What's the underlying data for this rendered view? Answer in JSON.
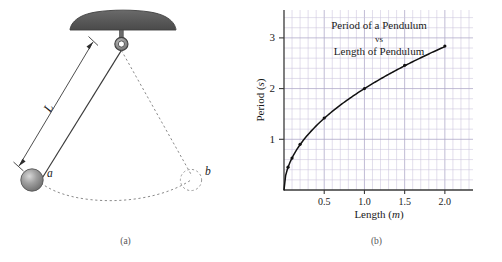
{
  "figure": {
    "panel_a": {
      "caption": "(a)",
      "labels": {
        "length": "L",
        "position_a": "a",
        "position_b": "b"
      },
      "parts": {
        "ceiling_mount": "ceiling-mount",
        "pivot_ring": "pivot-ring",
        "string": "pendulum-string",
        "bob": "pendulum-bob",
        "swing_arc": "swing-arc",
        "length_arrow": "length-dimension-arrow"
      },
      "colors": {
        "mount_fill": "#5c5c5c",
        "bob_fill": "#8f8f8f",
        "line": "#3a3a3a",
        "dash": "#7a7a7a"
      }
    },
    "panel_b": {
      "caption": "(b)",
      "colors": {
        "grid_minor": "#c9c3dd",
        "grid_major": "#b0a9c9",
        "axis": "#3a3a3a",
        "curve": "#111111"
      }
    }
  },
  "chart_data": {
    "type": "line",
    "title": "Period of a Pendulum\nvs\nLength of Pendulum",
    "title_lines": [
      "Period of a Pendulum",
      "vs",
      "Length of Pendulum"
    ],
    "xlabel": "Length (m)",
    "xlabel_main": "Length (",
    "xlabel_unit": "m",
    "xlabel_close": ")",
    "ylabel": "Period (s)",
    "ylabel_main": "Period (",
    "ylabel_unit": "s",
    "ylabel_close": ")",
    "xlim": [
      0,
      2.3
    ],
    "ylim": [
      0,
      3.55
    ],
    "xticks": [
      0.5,
      1.0,
      1.5,
      2.0
    ],
    "xticklabels": [
      "0.5",
      "1.0",
      "1.5",
      "2.0"
    ],
    "yticks": [
      1,
      2,
      3
    ],
    "yticklabels": [
      "1",
      "2",
      "3"
    ],
    "grid": true,
    "grid_step_x": 0.1,
    "grid_step_y": 0.2,
    "legend": "none",
    "series": [
      {
        "name": "Period vs Length",
        "x": [
          0.0,
          0.05,
          0.1,
          0.2,
          0.5,
          1.0,
          1.5,
          2.0
        ],
        "y": [
          0.0,
          0.45,
          0.63,
          0.9,
          1.42,
          2.0,
          2.46,
          2.84
        ],
        "markers_x": [
          0.05,
          0.1,
          0.2,
          0.5,
          1.0,
          1.5,
          2.0
        ],
        "markers_y": [
          0.45,
          0.63,
          0.9,
          1.42,
          2.0,
          2.46,
          2.84
        ]
      }
    ]
  }
}
